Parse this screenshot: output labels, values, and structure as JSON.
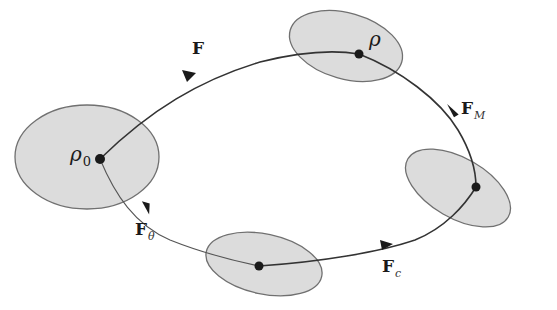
{
  "diagram": {
    "type": "state-flow",
    "colors": {
      "ellipse_fill": "#dcdcdc",
      "ellipse_stroke": "#707070",
      "path_stroke": "#333333",
      "node_fill": "#1a1a1a"
    },
    "nodes": [
      {
        "id": "rho0",
        "label": "ρ",
        "subscript": "0",
        "cx": 100,
        "cy": 159
      },
      {
        "id": "rho",
        "label": "ρ",
        "subscript": "",
        "cx": 359,
        "cy": 54
      },
      {
        "id": "right",
        "label": "",
        "subscript": "",
        "cx": 476,
        "cy": 187
      },
      {
        "id": "bottom",
        "label": "",
        "subscript": "",
        "cx": 259,
        "cy": 266
      }
    ],
    "edges": [
      {
        "id": "F",
        "from": "rho0",
        "to": "rho",
        "label": "F",
        "subscript": ""
      },
      {
        "id": "FM",
        "from": "rho",
        "to": "right",
        "label": "F",
        "subscript": "M"
      },
      {
        "id": "Fc",
        "from": "bottom",
        "to": "right",
        "label": "F",
        "subscript": "c"
      },
      {
        "id": "Ftheta",
        "from": "rho0",
        "to": "bottom",
        "label": "F",
        "subscript": "θ"
      }
    ]
  }
}
